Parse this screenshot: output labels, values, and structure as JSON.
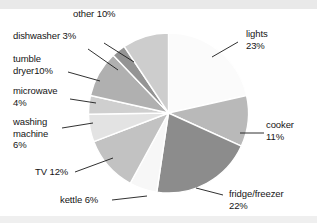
{
  "chart_data": {
    "type": "pie",
    "title": "",
    "subtitle": "",
    "xlabel": "",
    "ylabel": "",
    "legend_position": "none",
    "grid": false,
    "units": "percent",
    "categories": [
      "lights",
      "cooker",
      "fridge/freezer",
      "kettle",
      "TV",
      "washing machine",
      "microwave",
      "tumble dryer",
      "dishwasher",
      "other"
    ],
    "values": [
      23,
      11,
      22,
      6,
      12,
      6,
      4,
      10,
      3,
      10
    ],
    "slices": [
      {
        "label": "lights",
        "value": 23,
        "label_text": "lights\n23%",
        "color": "#fbfbfb"
      },
      {
        "label": "cooker",
        "value": 11,
        "label_text": "cooker\n11%",
        "color": "#b9b9b9"
      },
      {
        "label": "fridge/freezer",
        "value": 22,
        "label_text": "fridge/freezer\n22%",
        "color": "#8c8c8c"
      },
      {
        "label": "kettle",
        "value": 6,
        "label_text": "kettle 6%",
        "color": "#f7f7f7"
      },
      {
        "label": "TV",
        "value": 12,
        "label_text": "TV 12%",
        "color": "#c2c2c2"
      },
      {
        "label": "washing machine",
        "value": 6,
        "label_text": "washing\nmachine\n6%",
        "color": "#e3e3e3"
      },
      {
        "label": "microwave",
        "value": 4,
        "label_text": "microwave\n4%",
        "color": "#cfcfcf"
      },
      {
        "label": "tumble dryer",
        "value": 10,
        "label_text": "tumble\ndryer10%",
        "color": "#b0b0b0"
      },
      {
        "label": "dishwasher",
        "value": 3,
        "label_text": "dishwasher 3%",
        "color": "#949494"
      },
      {
        "label": "other",
        "value": 10,
        "label_text": "other 10%",
        "color": "#cdcdcd"
      }
    ]
  },
  "labels": {
    "other": "other 10%",
    "dishwasher": "dishwasher 3%",
    "tumble_dryer": "tumble\ndryer10%",
    "microwave": "microwave\n4%",
    "washing_machine": "washing\nmachine\n6%",
    "tv": "TV 12%",
    "kettle": "kettle 6%",
    "lights": "lights\n23%",
    "cooker": "cooker\n11%",
    "fridge_freezer": "fridge/freezer\n22%"
  },
  "colors": {
    "text": "#151515",
    "background": "#ffffff",
    "scan_band": "#e9e9e9",
    "slice_outline": "#ffffff",
    "leader_line": "#1a1a1a"
  }
}
